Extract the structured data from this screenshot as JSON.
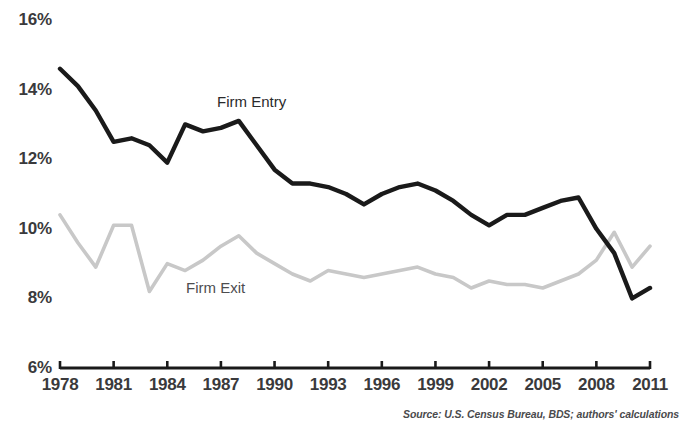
{
  "chart_data": {
    "type": "line",
    "title": "",
    "xlabel": "",
    "ylabel": "",
    "x": [
      1978,
      1979,
      1980,
      1981,
      1982,
      1983,
      1984,
      1985,
      1986,
      1987,
      1988,
      1989,
      1990,
      1991,
      1992,
      1993,
      1994,
      1995,
      1996,
      1997,
      1998,
      1999,
      2000,
      2001,
      2002,
      2003,
      2004,
      2005,
      2006,
      2007,
      2008,
      2009,
      2010,
      2011
    ],
    "xlim": [
      1978,
      2011
    ],
    "ylim": [
      6,
      16
    ],
    "grid": false,
    "legend_position": "inline-annotation",
    "series": [
      {
        "name": "Firm Entry",
        "color": "#1a1a1a",
        "values": [
          14.6,
          14.1,
          13.4,
          12.5,
          12.6,
          12.4,
          11.9,
          13.0,
          12.8,
          12.9,
          13.1,
          12.4,
          11.7,
          11.3,
          11.3,
          11.2,
          11.0,
          10.7,
          11.0,
          11.2,
          11.3,
          11.1,
          10.8,
          10.4,
          10.1,
          10.4,
          10.4,
          10.6,
          10.8,
          10.9,
          10.0,
          9.3,
          8.0,
          8.3
        ]
      },
      {
        "name": "Firm Exit",
        "color": "#c8c8c8",
        "values": [
          10.4,
          9.6,
          8.9,
          10.1,
          10.1,
          8.2,
          9.0,
          8.8,
          9.1,
          9.5,
          9.8,
          9.3,
          9.0,
          8.7,
          8.5,
          8.8,
          8.7,
          8.6,
          8.7,
          8.8,
          8.9,
          8.7,
          8.6,
          8.3,
          8.5,
          8.4,
          8.4,
          8.3,
          8.5,
          8.7,
          9.1,
          9.9,
          8.9,
          9.5
        ]
      }
    ],
    "y_ticks": [
      {
        "label": "16%",
        "value": 16
      },
      {
        "label": "14%",
        "value": 14
      },
      {
        "label": "12%",
        "value": 12
      },
      {
        "label": "10%",
        "value": 10
      },
      {
        "label": "8%",
        "value": 8
      },
      {
        "label": "6%",
        "value": 6
      }
    ],
    "x_ticks": [
      {
        "label": "1978",
        "value": 1978
      },
      {
        "label": "1981",
        "value": 1981
      },
      {
        "label": "1984",
        "value": 1984
      },
      {
        "label": "1987",
        "value": 1987
      },
      {
        "label": "1990",
        "value": 1990
      },
      {
        "label": "1993",
        "value": 1993
      },
      {
        "label": "1996",
        "value": 1996
      },
      {
        "label": "1999",
        "value": 1999
      },
      {
        "label": "2002",
        "value": 2002
      },
      {
        "label": "2005",
        "value": 2005
      },
      {
        "label": "2008",
        "value": 2008
      },
      {
        "label": "2011",
        "value": 2011
      }
    ],
    "annotations": [
      {
        "name": "entry-series-label",
        "text": "Firm Entry"
      },
      {
        "name": "exit-series-label",
        "text": "Firm Exit"
      }
    ],
    "source": "Source: U.S. Census Bureau, BDS; authors' calculations"
  }
}
